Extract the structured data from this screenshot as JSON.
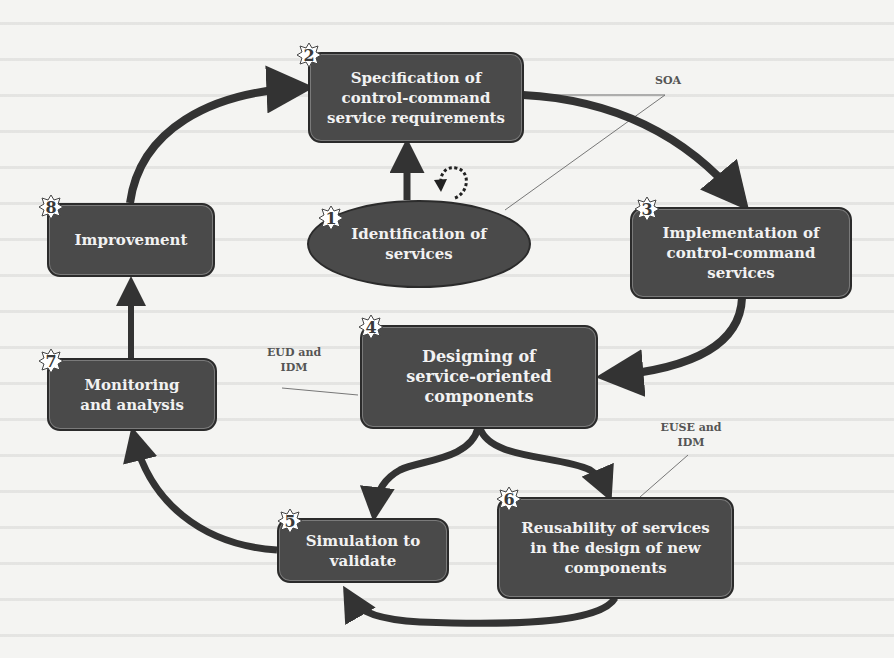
{
  "diagram": {
    "type": "process-cycle",
    "colors": {
      "box_fill": "#4a4a4a",
      "box_border": "#2b2b2b",
      "box_text": "#f2f2f2",
      "arrow": "#333333",
      "annotation_text": "#555555",
      "background": "#f4f4f2"
    },
    "steps": [
      {
        "number": "1",
        "label": "Identification of services",
        "shape": "ellipse"
      },
      {
        "number": "2",
        "label": "Specification of control-command service requirements",
        "shape": "rounded-box"
      },
      {
        "number": "3",
        "label": "Implementation of control-command services",
        "shape": "rounded-box"
      },
      {
        "number": "4",
        "label": "Designing of service-oriented components",
        "shape": "rounded-box"
      },
      {
        "number": "5",
        "label": "Simulation to validate",
        "shape": "rounded-box"
      },
      {
        "number": "6",
        "label": "Reusability of services in the design of new components",
        "shape": "rounded-box"
      },
      {
        "number": "7",
        "label": "Monitoring and analysis",
        "shape": "rounded-box"
      },
      {
        "number": "8",
        "label": "Improvement",
        "shape": "rounded-box"
      }
    ],
    "annotations": [
      {
        "label": "SOA"
      },
      {
        "label": "EUD and IDM"
      },
      {
        "label": "EUSE and IDM"
      }
    ],
    "edges": [
      {
        "from": "1",
        "to": "2"
      },
      {
        "from": "1",
        "to": "1",
        "style": "dashed-loop"
      },
      {
        "from": "2",
        "to": "3"
      },
      {
        "from": "3",
        "to": "4"
      },
      {
        "from": "4",
        "to": "5"
      },
      {
        "from": "4",
        "to": "6"
      },
      {
        "from": "6",
        "to": "5"
      },
      {
        "from": "5",
        "to": "7"
      },
      {
        "from": "7",
        "to": "8"
      },
      {
        "from": "8",
        "to": "2"
      }
    ]
  }
}
